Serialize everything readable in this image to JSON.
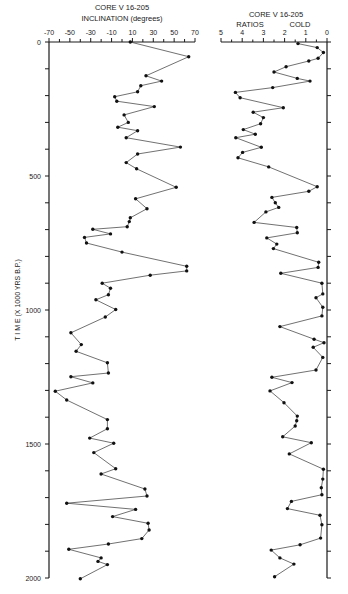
{
  "chart_data": [
    {
      "type": "line",
      "title": "CORE V 16-205",
      "subtitle": "INCLINATION (degrees)",
      "xlabel": "INCLINATION (degrees)",
      "ylabel": "T I M E   (X 1000 YRS B.P.)",
      "xlim": [
        -70,
        70
      ],
      "ylim": [
        0,
        2000
      ],
      "y_inverted": true,
      "grid": false,
      "x_ticks": [
        "-70",
        "-50",
        "-30",
        "-10",
        "10",
        "30",
        "50",
        "70"
      ],
      "y_ticks": [
        "0",
        "500",
        "1000",
        "1500",
        "2000"
      ],
      "series": [
        {
          "name": "Inclination",
          "points": [
            [
              0,
              8
            ],
            [
              55,
              64
            ],
            [
              126,
              23
            ],
            [
              146,
              38
            ],
            [
              163,
              18
            ],
            [
              186,
              15
            ],
            [
              204,
              -7
            ],
            [
              221,
              -5
            ],
            [
              241,
              31
            ],
            [
              272,
              2
            ],
            [
              300,
              6
            ],
            [
              318,
              -4
            ],
            [
              331,
              15
            ],
            [
              357,
              4
            ],
            [
              392,
              56
            ],
            [
              418,
              15
            ],
            [
              450,
              4
            ],
            [
              473,
              14
            ],
            [
              542,
              52
            ],
            [
              585,
              13
            ],
            [
              622,
              24
            ],
            [
              656,
              8
            ],
            [
              670,
              7
            ],
            [
              689,
              5
            ],
            [
              699,
              -28
            ],
            [
              716,
              -11
            ],
            [
              729,
              -36
            ],
            [
              750,
              -34
            ],
            [
              784,
              0
            ],
            [
              837,
              62
            ],
            [
              854,
              62
            ],
            [
              870,
              27
            ],
            [
              900,
              -19
            ],
            [
              919,
              -11
            ],
            [
              943,
              -13
            ],
            [
              962,
              -25
            ],
            [
              998,
              -6
            ],
            [
              1026,
              -16
            ],
            [
              1085,
              -49
            ],
            [
              1129,
              -39
            ],
            [
              1154,
              -44
            ],
            [
              1197,
              -14
            ],
            [
              1235,
              -13
            ],
            [
              1249,
              -49
            ],
            [
              1272,
              -28
            ],
            [
              1303,
              -64
            ],
            [
              1336,
              -53
            ],
            [
              1409,
              -14
            ],
            [
              1443,
              -14
            ],
            [
              1478,
              -31
            ],
            [
              1497,
              -8
            ],
            [
              1532,
              -27
            ],
            [
              1592,
              -6
            ],
            [
              1612,
              -20
            ],
            [
              1668,
              22
            ],
            [
              1694,
              24
            ],
            [
              1721,
              -53
            ],
            [
              1744,
              13
            ],
            [
              1771,
              -9
            ],
            [
              1796,
              25
            ],
            [
              1821,
              26
            ],
            [
              1853,
              19
            ],
            [
              1873,
              -13
            ],
            [
              1893,
              -51
            ],
            [
              1925,
              -20
            ],
            [
              1938,
              -23
            ],
            [
              1950,
              -14
            ],
            [
              2003,
              -40
            ]
          ]
        }
      ]
    },
    {
      "type": "line",
      "title": "CORE V 16-205",
      "subtitle": "RATIOS",
      "annotation": "COLD",
      "xlabel": "RATIOS",
      "xlim": [
        5,
        0
      ],
      "ylim": [
        0,
        2000
      ],
      "y_inverted": true,
      "grid": false,
      "x_ticks": [
        "5",
        "4",
        "3",
        "2",
        "1",
        "0"
      ],
      "series": [
        {
          "name": "Ratios",
          "points": [
            [
              6,
              1.37
            ],
            [
              21,
              0.46
            ],
            [
              39,
              0.17
            ],
            [
              61,
              0.42
            ],
            [
              71,
              0.86
            ],
            [
              92,
              1.93
            ],
            [
              112,
              2.5
            ],
            [
              136,
              1.4
            ],
            [
              146,
              0.8
            ],
            [
              170,
              2.56
            ],
            [
              188,
              4.32
            ],
            [
              208,
              4.1
            ],
            [
              245,
              2.06
            ],
            [
              262,
              3.48
            ],
            [
              282,
              3.0
            ],
            [
              305,
              3.13
            ],
            [
              327,
              3.95
            ],
            [
              344,
              3.38
            ],
            [
              357,
              4.3
            ],
            [
              393,
              3.1
            ],
            [
              412,
              3.98
            ],
            [
              432,
              4.2
            ],
            [
              466,
              2.75
            ],
            [
              540,
              0.46
            ],
            [
              557,
              0.86
            ],
            [
              580,
              2.6
            ],
            [
              600,
              2.44
            ],
            [
              617,
              2.28
            ],
            [
              634,
              2.88
            ],
            [
              673,
              3.44
            ],
            [
              692,
              1.43
            ],
            [
              712,
              1.4
            ],
            [
              731,
              2.84
            ],
            [
              754,
              2.37
            ],
            [
              771,
              2.53
            ],
            [
              822,
              0.39
            ],
            [
              841,
              0.42
            ],
            [
              863,
              2.18
            ],
            [
              900,
              0.24
            ],
            [
              940,
              0.2
            ],
            [
              954,
              0.52
            ],
            [
              990,
              0.2
            ],
            [
              1022,
              0.24
            ],
            [
              1062,
              2.22
            ],
            [
              1109,
              0.61
            ],
            [
              1122,
              0.14
            ],
            [
              1139,
              0.65
            ],
            [
              1177,
              0.2
            ],
            [
              1224,
              0.52
            ],
            [
              1251,
              2.6
            ],
            [
              1271,
              1.65
            ],
            [
              1302,
              2.69
            ],
            [
              1346,
              2.03
            ],
            [
              1396,
              1.4
            ],
            [
              1413,
              1.43
            ],
            [
              1433,
              1.5
            ],
            [
              1473,
              2.09
            ],
            [
              1495,
              0.74
            ],
            [
              1537,
              1.78
            ],
            [
              1594,
              0.17
            ],
            [
              1631,
              0.2
            ],
            [
              1663,
              0.27
            ],
            [
              1689,
              0.24
            ],
            [
              1714,
              1.68
            ],
            [
              1741,
              1.87
            ],
            [
              1766,
              0.33
            ],
            [
              1801,
              0.24
            ],
            [
              1851,
              0.3
            ],
            [
              1876,
              1.27
            ],
            [
              1896,
              2.63
            ],
            [
              1925,
              2.22
            ],
            [
              1948,
              1.56
            ],
            [
              1995,
              2.47
            ]
          ]
        }
      ]
    }
  ],
  "labels": {
    "left_title": "CORE V 16-205",
    "left_subtitle": "INCLINATION  (degrees)",
    "right_title": "CORE V 16-205",
    "right_subtitle_left": "RATIOS",
    "right_subtitle_right": "COLD",
    "y_axis_label": "T I M E   (X 1000 YRS B.P.)"
  },
  "colors": {
    "ink": "#1a1a1a",
    "background": "#ffffff"
  }
}
